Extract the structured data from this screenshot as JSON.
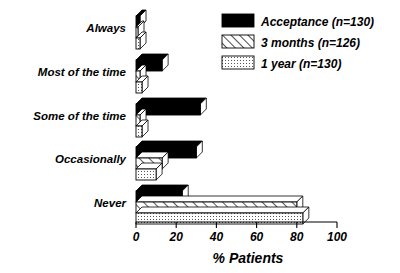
{
  "chart_data": {
    "type": "bar",
    "orientation": "horizontal",
    "title": "",
    "xlabel": "% Patients",
    "ylabel": "",
    "xlim": [
      0,
      100
    ],
    "xticks": [
      0,
      20,
      40,
      60,
      80,
      100
    ],
    "xtick_labels": [
      "0",
      "20",
      "40",
      "60",
      "80",
      "100"
    ],
    "grid": false,
    "legend_position": "top-right",
    "categories": [
      "Always",
      "Most of the time",
      "Some of the time",
      "Occasionally",
      "Never"
    ],
    "series": [
      {
        "name": "Acceptance (n=130)",
        "pattern": "solid-black",
        "color": "#000000",
        "values": [
          2,
          13,
          32,
          30,
          23
        ]
      },
      {
        "name": "3 months (n=126)",
        "pattern": "diagonal-hatch",
        "color": "#ffffff",
        "values": [
          1,
          2,
          2,
          13,
          80
        ]
      },
      {
        "name": "1 year (n=130)",
        "pattern": "dotted",
        "color": "#ffffff",
        "values": [
          2,
          3,
          3,
          10,
          83
        ]
      }
    ]
  },
  "legend": {
    "entries": [
      {
        "label": "Acceptance (n=130)",
        "swatch": "solid-black-swatch"
      },
      {
        "label": "3 months (n=126)",
        "swatch": "hatch-swatch"
      },
      {
        "label": "1 year (n=130)",
        "swatch": "dotted-swatch"
      }
    ]
  },
  "axis": {
    "x_title": "% Patients",
    "ticks": [
      "0",
      "20",
      "40",
      "60",
      "80",
      "100"
    ]
  }
}
